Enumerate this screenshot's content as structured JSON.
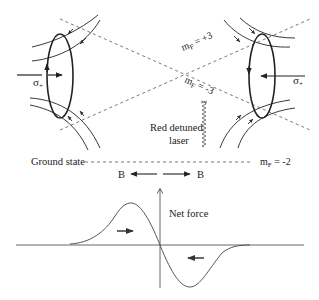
{
  "diagram": {
    "colors": {
      "ink": "#222222",
      "dashed": "#777777",
      "curve": "#555555",
      "background": "#ffffff"
    },
    "labels": {
      "sigma_left": "σ",
      "sigma_left_sub": "+",
      "sigma_right": "σ",
      "sigma_right_sub": "+",
      "mf_plus3_main": "m",
      "mf_plus3_sub": "F",
      "mf_plus3_val": " = +3",
      "mf_minus3_main": "m",
      "mf_minus3_sub": "F",
      "mf_minus3_val": " = -3",
      "laser_line1": "Red detuned",
      "laser_line2": "laser",
      "ground_state": "Ground state",
      "mf_minus2_main": "m",
      "mf_minus2_sub": "F",
      "mf_minus2_val": " = -2",
      "b_left": "B",
      "b_right": "B",
      "net_force": "Net force"
    },
    "icons": {
      "laser": "wavy-line-icon",
      "field_arrow": "arrow-icon"
    }
  }
}
